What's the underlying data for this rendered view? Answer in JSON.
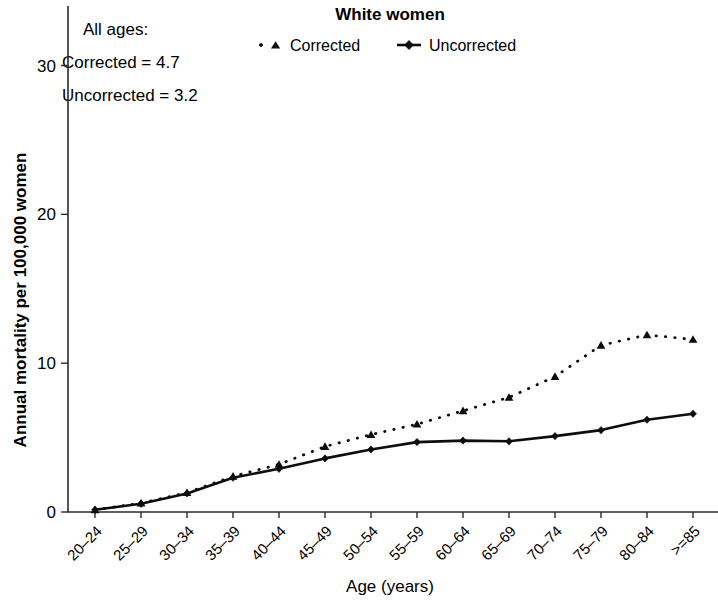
{
  "chart_data": {
    "type": "line",
    "title": "White women",
    "xlabel": "Age (years)",
    "ylabel": "Annual mortality per 100,000 women",
    "categories": [
      "20–24",
      "25–29",
      "30–34",
      "35–39",
      "40–44",
      "45–49",
      "50–54",
      "55–59",
      "60–64",
      "65–69",
      "70–74",
      "75–79",
      "80–84",
      ">=85"
    ],
    "series": [
      {
        "name": "Corrected",
        "marker": "triangle",
        "linestyle": "dotted",
        "color": "#0d0d0d",
        "values": [
          0.15,
          0.6,
          1.3,
          2.4,
          3.2,
          4.4,
          5.2,
          5.9,
          6.8,
          7.7,
          9.1,
          11.2,
          11.9,
          11.6
        ]
      },
      {
        "name": "Uncorrected",
        "marker": "diamond",
        "linestyle": "solid",
        "color": "#0d0d0d",
        "values": [
          0.15,
          0.55,
          1.25,
          2.3,
          2.9,
          3.6,
          4.2,
          4.7,
          4.8,
          4.75,
          5.1,
          5.5,
          6.2,
          6.6
        ]
      }
    ],
    "ylim": [
      0,
      34
    ],
    "yticks": [
      "0",
      "10",
      "20",
      "30"
    ],
    "ytick_values": [
      0,
      10,
      20,
      30
    ],
    "xlim": [
      0,
      13
    ],
    "grid": false,
    "legend_position": "top-center",
    "annotation": {
      "line1": "All ages:",
      "line2": "Corrected = 4.7",
      "line3": "Uncorrected = 3.2"
    }
  },
  "legend": {
    "items": [
      {
        "label": "Corrected"
      },
      {
        "label": "Uncorrected"
      }
    ]
  }
}
